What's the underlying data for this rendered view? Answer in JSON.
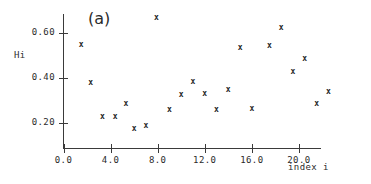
{
  "figure": {
    "panel_label": "(a)",
    "background_color": "#ffffff",
    "axis_color": "#3a3a3a",
    "marker_color": "#262626",
    "marker_glyph": "x"
  },
  "chart_data": {
    "type": "scatter",
    "title": "(a)",
    "xlabel": "index i",
    "ylabel": "Hi",
    "xlim": [
      0.0,
      22.0
    ],
    "ylim": [
      0.1,
      0.7
    ],
    "grid": false,
    "legend": null,
    "xticks": [
      "0.0",
      "4.0",
      "8.0",
      "12.0",
      "16.0",
      "20.0"
    ],
    "xtick_values": [
      0.0,
      4.0,
      8.0,
      12.0,
      16.0,
      20.0
    ],
    "yticks": [
      "0.20",
      "0.40",
      "0.60"
    ],
    "ytick_values": [
      0.2,
      0.4,
      0.6
    ],
    "marker": "x",
    "x": [
      1.5,
      2.3,
      3.3,
      4.4,
      5.3,
      6.0,
      7.0,
      7.9,
      9.0,
      10.0,
      11.0,
      12.0,
      13.0,
      14.0,
      15.0,
      16.0,
      17.5,
      18.5,
      19.5,
      20.5,
      21.5,
      22.5
    ],
    "y": [
      0.55,
      0.38,
      0.23,
      0.23,
      0.285,
      0.175,
      0.19,
      0.67,
      0.26,
      0.325,
      0.385,
      0.33,
      0.26,
      0.35,
      0.535,
      0.265,
      0.545,
      0.625,
      0.43,
      0.485,
      0.285,
      0.34
    ],
    "points": [
      {
        "x": 1.5,
        "y": 0.55
      },
      {
        "x": 2.3,
        "y": 0.38
      },
      {
        "x": 3.3,
        "y": 0.23
      },
      {
        "x": 4.4,
        "y": 0.23
      },
      {
        "x": 5.3,
        "y": 0.285
      },
      {
        "x": 6.0,
        "y": 0.175
      },
      {
        "x": 7.0,
        "y": 0.19
      },
      {
        "x": 7.9,
        "y": 0.67
      },
      {
        "x": 9.0,
        "y": 0.26
      },
      {
        "x": 10.0,
        "y": 0.325
      },
      {
        "x": 11.0,
        "y": 0.385
      },
      {
        "x": 12.0,
        "y": 0.33
      },
      {
        "x": 13.0,
        "y": 0.26
      },
      {
        "x": 14.0,
        "y": 0.35
      },
      {
        "x": 15.0,
        "y": 0.535
      },
      {
        "x": 16.0,
        "y": 0.265
      },
      {
        "x": 17.5,
        "y": 0.545
      },
      {
        "x": 18.5,
        "y": 0.625
      },
      {
        "x": 19.5,
        "y": 0.43
      },
      {
        "x": 20.5,
        "y": 0.485
      },
      {
        "x": 21.5,
        "y": 0.285
      },
      {
        "x": 22.5,
        "y": 0.34
      }
    ]
  }
}
